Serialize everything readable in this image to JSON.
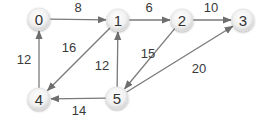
{
  "graph": {
    "type": "directed-weighted",
    "nodes": [
      {
        "id": "0",
        "label": "0",
        "x": 39,
        "y": 19
      },
      {
        "id": "1",
        "label": "1",
        "x": 118,
        "y": 20
      },
      {
        "id": "2",
        "label": "2",
        "x": 182,
        "y": 20
      },
      {
        "id": "3",
        "label": "3",
        "x": 243,
        "y": 20
      },
      {
        "id": "4",
        "label": "4",
        "x": 39,
        "y": 99
      },
      {
        "id": "5",
        "label": "5",
        "x": 117,
        "y": 98
      }
    ],
    "edges": [
      {
        "from": "0",
        "to": "1",
        "weight": "8"
      },
      {
        "from": "1",
        "to": "2",
        "weight": "6"
      },
      {
        "from": "2",
        "to": "3",
        "weight": "10"
      },
      {
        "from": "1",
        "to": "4",
        "weight": "16"
      },
      {
        "from": "4",
        "to": "0",
        "weight": "12"
      },
      {
        "from": "5",
        "to": "1",
        "weight": "12"
      },
      {
        "from": "2",
        "to": "5",
        "weight": "15"
      },
      {
        "from": "5",
        "to": "3",
        "weight": "20"
      },
      {
        "from": "5",
        "to": "4",
        "weight": "14"
      }
    ]
  },
  "colors": {
    "edge": "#7a7a7a",
    "node_fill_center": "#ffffff",
    "node_fill_edge": "#d6d6d6",
    "text": "#333333"
  }
}
